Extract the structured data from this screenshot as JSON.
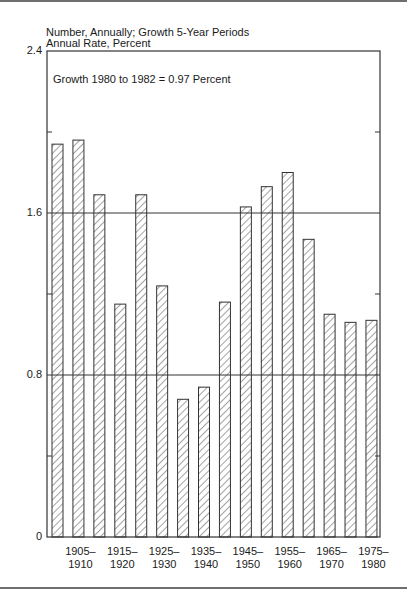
{
  "chart_data": {
    "type": "bar",
    "title": "Number, Annually; Growth 5-Year Periods",
    "subtitle": "Annual Rate, Percent",
    "annotation": "Growth 1980 to 1982 = 0.97 Percent",
    "xlabel": "",
    "ylabel": "Annual Rate, Percent",
    "ylim": [
      0,
      2.4
    ],
    "yticks": [
      "0",
      "0.8",
      "1.6",
      "2.4"
    ],
    "gridlines": [
      0.8,
      1.6
    ],
    "categories": [
      "1900–1905",
      "1905–1910",
      "1910–1915",
      "1915–1920",
      "1920–1925",
      "1925–1930",
      "1930–1935",
      "1935–1940",
      "1940–1945",
      "1945–1950",
      "1950–1955",
      "1955–1960",
      "1960–1965",
      "1965–1970",
      "1970–1975",
      "1975–1980"
    ],
    "values": [
      1.94,
      1.96,
      1.69,
      1.15,
      1.69,
      1.24,
      0.68,
      0.74,
      1.16,
      1.63,
      1.73,
      1.8,
      1.47,
      1.1,
      1.06,
      1.07
    ],
    "xtick_labels": [
      {
        "line1": "1905–",
        "line2": "1910"
      },
      {
        "line1": "1915–",
        "line2": "1920"
      },
      {
        "line1": "1925–",
        "line2": "1930"
      },
      {
        "line1": "1935–",
        "line2": "1940"
      },
      {
        "line1": "1945–",
        "line2": "1950"
      },
      {
        "line1": "1955–",
        "line2": "1960"
      },
      {
        "line1": "1965–",
        "line2": "1970"
      },
      {
        "line1": "1975–",
        "line2": "1980"
      }
    ],
    "legend": null,
    "grid": true
  }
}
